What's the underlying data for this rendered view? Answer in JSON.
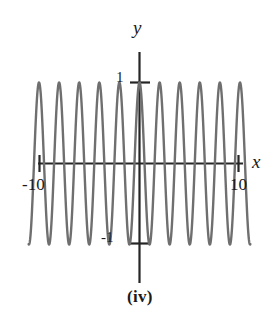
{
  "figure": {
    "caption": "(iv)",
    "axis_labels": {
      "x": "x",
      "y": "y"
    },
    "x_ticks": {
      "left": "-10",
      "right": "10"
    },
    "y_ticks": {
      "top": "1",
      "bottom": "-1"
    },
    "colors": {
      "curve": "#6f6f6f",
      "axis": "#262626",
      "text": "#1a1a1a",
      "background": "#ffffff"
    }
  },
  "chart_data": {
    "type": "line",
    "title": "(iv)",
    "xlabel": "x",
    "ylabel": "y",
    "xlim": [
      -11.2,
      11.2
    ],
    "ylim": [
      -1.45,
      1.45
    ],
    "xticks": [
      -10,
      10
    ],
    "xticklabels": [
      "-10",
      "10"
    ],
    "yticks": [
      -1,
      1
    ],
    "yticklabels": [
      "-1",
      "1"
    ],
    "grid": false,
    "legend": null,
    "series": [
      {
        "name": "y = cos(3.1x)",
        "description": "High-frequency cosine wave, amplitude 1, period about 2.03 x-units, peak at x = 0",
        "amplitude": 1,
        "period": 2.03,
        "phase": "cosine (maximum at x=0)",
        "x": [
          -11.2,
          -11.0,
          -10.7,
          -10.4,
          -10.2,
          -9.9,
          -9.6,
          -9.4,
          -9.1,
          -8.9,
          -8.6,
          -8.4,
          -8.1,
          -7.9,
          -7.6,
          -7.4,
          -7.1,
          -6.9,
          -6.6,
          -6.4,
          -6.1,
          -5.9,
          -5.6,
          -5.4,
          -5.1,
          -4.9,
          -4.6,
          -4.4,
          -4.1,
          -3.9,
          -3.6,
          -3.4,
          -3.1,
          -2.9,
          -2.6,
          -2.4,
          -2.1,
          -1.9,
          -1.6,
          -1.4,
          -1.1,
          -0.9,
          -0.6,
          -0.4,
          -0.1,
          0.0,
          0.1,
          0.4,
          0.6,
          0.9,
          1.1,
          1.4,
          1.6,
          1.9,
          2.1,
          2.4,
          2.6,
          2.9,
          3.1,
          3.4,
          3.6,
          3.9,
          4.1,
          4.4,
          4.6,
          4.9,
          5.1,
          5.4,
          5.6,
          5.9,
          6.1,
          6.4,
          6.6,
          6.9,
          7.1,
          7.4,
          7.6,
          7.9,
          8.1,
          8.4,
          8.6,
          8.9,
          9.1,
          9.4,
          9.6,
          9.9,
          10.1,
          10.4,
          10.6,
          10.9,
          11.2
        ],
        "y_formula": "cos(2*pi*x/2.03)"
      }
    ],
    "peaks_x": [
      -10.15,
      -8.12,
      -6.09,
      -4.06,
      -2.03,
      0,
      2.03,
      4.06,
      6.09,
      8.12,
      10.15
    ],
    "troughs_x": [
      -11.17,
      -9.14,
      -7.11,
      -5.08,
      -3.05,
      -1.02,
      1.02,
      3.05,
      5.08,
      7.11,
      9.14,
      11.17
    ],
    "peak_value": 1,
    "trough_value": -1
  }
}
